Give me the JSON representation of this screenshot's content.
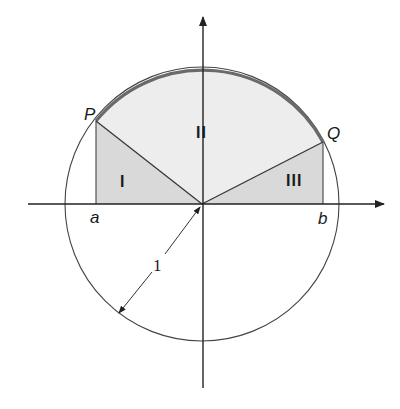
{
  "diagram": {
    "colors": {
      "background": "#ffffff",
      "line": "#333333",
      "arc_highlight": "#6a6a6a",
      "light_fill": "#ededed",
      "triangle_fill": "#d9d9d9"
    },
    "points": {
      "P": "P",
      "Q": "Q",
      "a": "a",
      "b": "b"
    },
    "regions": {
      "I": "I",
      "II": "II",
      "III": "III"
    },
    "radius_label": "1"
  }
}
